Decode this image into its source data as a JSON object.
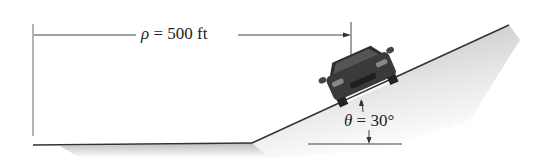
{
  "diagram": {
    "radius_label": {
      "symbol": "ρ",
      "equals": " = ",
      "value": "500 ft"
    },
    "angle_label": {
      "symbol": "θ",
      "equals": " = ",
      "value": "30°"
    },
    "colors": {
      "line": "#333333",
      "ground_shadow": "#cfcfcf",
      "car_body": "#3a3a3a",
      "background": "#ffffff"
    },
    "elements": [
      "horizontal-ground",
      "inclined-slope",
      "car",
      "radius-dimension",
      "angle-dimension"
    ]
  }
}
